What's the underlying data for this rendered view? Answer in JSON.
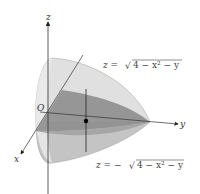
{
  "diagram": {
    "type": "3d-solid-region",
    "axes": {
      "x": "x",
      "y": "y",
      "z": "z",
      "origin": "O"
    },
    "upper_surface": {
      "label": "z = √(4 − x² − y)",
      "z": "z =",
      "sqrt": "√",
      "radicand": "4 − x² − y"
    },
    "lower_surface": {
      "label": "z = −√(4 − x² − y)",
      "z": "z = −",
      "sqrt": "√",
      "radicand": "4 − x² − y"
    },
    "colors": {
      "solid_light": "#d6d6d6",
      "solid_mid": "#bdbdbd",
      "base_region": "#8a8a8a",
      "axis": "#333333"
    }
  }
}
